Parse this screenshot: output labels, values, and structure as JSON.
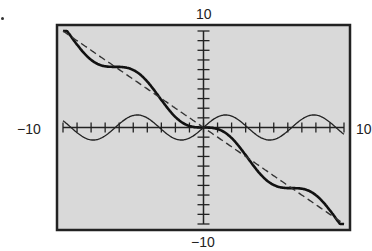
{
  "chart_data": {
    "type": "line",
    "title": "",
    "xlabel": "",
    "ylabel": "",
    "xlim": [
      -10,
      10
    ],
    "ylim": [
      -10,
      10
    ],
    "tick_step": 1,
    "grid": false,
    "legend": null,
    "tick_labels": {
      "x_min": "−10",
      "x_max": "10",
      "y_min": "−10",
      "y_max": "10"
    },
    "series": [
      {
        "name": "y = -x + sin x",
        "style": "thick solid",
        "function": "-x+sin(x)"
      },
      {
        "name": "y = -x",
        "style": "dashed",
        "function": "-x"
      },
      {
        "name": "y = sin x",
        "style": "thin solid",
        "function": "sin(x)"
      }
    ],
    "background": "#d9d9d9",
    "frame": {
      "left": 57,
      "top": 25,
      "right": 350,
      "bottom": 230
    }
  }
}
